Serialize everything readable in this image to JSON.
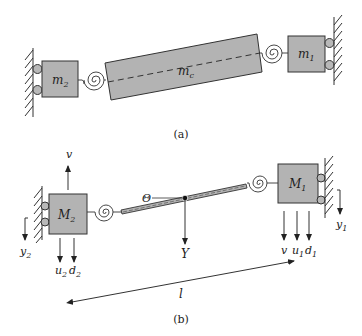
{
  "panel_a": {
    "caption": "(a)",
    "mass_left": "m",
    "mass_left_sub": "2",
    "mass_center": "m",
    "mass_center_sub": "c",
    "mass_right": "m",
    "mass_right_sub": "1"
  },
  "panel_b": {
    "caption": "(b)",
    "mass_left": "M",
    "mass_left_sub": "2",
    "mass_right": "M",
    "mass_right_sub": "1",
    "angle_label": "Θ",
    "center_force": "Y",
    "left_up_force": "v",
    "left_disp": "y",
    "left_disp_sub": "2",
    "left_down_1": "u",
    "left_down_1_sub": "2",
    "left_down_2": "d",
    "left_down_2_sub": "2",
    "right_down_0": "v",
    "right_down_1": "u",
    "right_down_1_sub": "1",
    "right_down_2": "d",
    "right_down_2_sub": "1",
    "right_disp": "y",
    "right_disp_sub": "1",
    "length": "l"
  },
  "colors": {
    "mass_fill": "#b3b3b3",
    "stroke": "#333333",
    "roller_fill": "#b8b8b8"
  }
}
